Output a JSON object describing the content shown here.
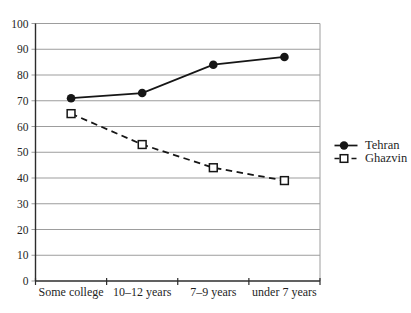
{
  "chart_data": {
    "type": "line",
    "title": "",
    "xlabel": "",
    "ylabel": "",
    "categories": [
      "Some college",
      "10–12 years",
      "7–9 years",
      "under 7 years"
    ],
    "series": [
      {
        "name": "Tehran",
        "values": [
          71,
          73,
          84,
          87
        ],
        "line_style": "solid",
        "marker": "filled-circle"
      },
      {
        "name": "Ghazvin",
        "values": [
          65,
          53,
          44,
          39
        ],
        "line_style": "dashed",
        "marker": "open-square"
      }
    ],
    "ylim": [
      0,
      100
    ],
    "y_ticks": [
      0,
      10,
      20,
      30,
      40,
      50,
      60,
      70,
      80,
      90,
      100
    ],
    "grid": "horizontal",
    "legend_position": "right"
  },
  "legend": {
    "items": [
      {
        "label": "Tehran",
        "marker": "filled-circle-solid-line"
      },
      {
        "label": "Ghazvin",
        "marker": "open-square-dashed-line"
      }
    ]
  },
  "colors": {
    "series_line": "#161616",
    "gridline": "#9d9d9d",
    "axis": "#2c2c2c",
    "text": "#1f1f1f",
    "background": "#ffffff"
  }
}
